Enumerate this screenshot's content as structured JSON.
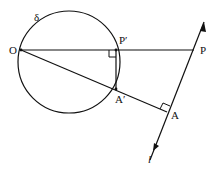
{
  "diagram": {
    "title": "",
    "labels": {
      "circle": "δ",
      "O": "O",
      "P_prime": "P′",
      "P": "P",
      "A_prime": "A′",
      "A": "A",
      "line": "l"
    },
    "stroke_color": "#111111",
    "background": "#ffffff"
  }
}
